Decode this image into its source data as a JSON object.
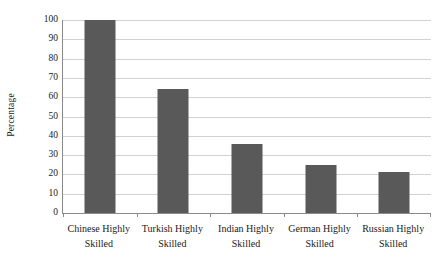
{
  "chart_data": {
    "type": "bar",
    "title": "",
    "xlabel": "",
    "ylabel": "Percentage",
    "ylim": [
      0,
      100
    ],
    "yticks": [
      0,
      10,
      20,
      30,
      40,
      50,
      60,
      70,
      80,
      90,
      100
    ],
    "ytick_labels": [
      "0",
      "10",
      "20",
      "30",
      "40",
      "50",
      "60",
      "70",
      "80",
      "90",
      "100"
    ],
    "grid": true,
    "legend": false,
    "categories": [
      "Chinese Highly Skilled",
      "Turkish Highly Skilled",
      "Indian Highly Skilled",
      "German Highly Skilled",
      "Russian Highly Skilled"
    ],
    "category_lines": [
      [
        "Chinese Highly",
        "Skilled"
      ],
      [
        "Turkish Highly",
        "Skilled"
      ],
      [
        "Indian Highly",
        "Skilled"
      ],
      [
        "German Highly",
        "Skilled"
      ],
      [
        "Russian Highly",
        "Skilled"
      ]
    ],
    "values": [
      100,
      64,
      36,
      25,
      21.5
    ],
    "bar_color": "#595959",
    "gridline_color": "#d2d2d2",
    "axis_color": "#8a8a8a"
  }
}
